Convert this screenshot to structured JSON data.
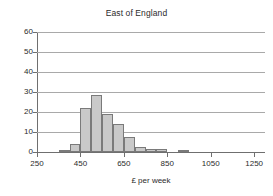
{
  "chart_data": {
    "type": "bar",
    "title": "East of England",
    "xlabel": "£ per week",
    "ylabel": "",
    "xlim": [
      250,
      1300
    ],
    "ylim": [
      0,
      60
    ],
    "grid": true,
    "legend": null,
    "xticks": [
      250,
      450,
      650,
      850,
      1050,
      1250
    ],
    "yticks": [
      0,
      10,
      20,
      30,
      40,
      50,
      60
    ],
    "bin_width": 50,
    "bins": [
      {
        "start": 350,
        "end": 400,
        "value": 0.5
      },
      {
        "start": 400,
        "end": 450,
        "value": 4.2
      },
      {
        "start": 450,
        "end": 500,
        "value": 22.0
      },
      {
        "start": 500,
        "end": 550,
        "value": 28.5
      },
      {
        "start": 550,
        "end": 600,
        "value": 19.0
      },
      {
        "start": 600,
        "end": 650,
        "value": 14.2
      },
      {
        "start": 650,
        "end": 700,
        "value": 7.6
      },
      {
        "start": 700,
        "end": 750,
        "value": 2.5
      },
      {
        "start": 750,
        "end": 800,
        "value": 1.4
      },
      {
        "start": 800,
        "end": 850,
        "value": 1.4
      },
      {
        "start": 900,
        "end": 950,
        "value": 0.5
      }
    ],
    "categories": [
      "350-400",
      "400-450",
      "450-500",
      "500-550",
      "550-600",
      "600-650",
      "650-700",
      "700-750",
      "750-800",
      "800-850",
      "900-950"
    ],
    "values": [
      0.5,
      4.2,
      22.0,
      28.5,
      19.0,
      14.2,
      7.6,
      2.5,
      1.4,
      1.4,
      0.5
    ],
    "colors": {
      "bar_fill": "#c9c9c9",
      "bar_stroke": "#7a7a7a",
      "gridline": "#a9a9a9",
      "axis": "#6f6f6f",
      "text": "#2b2b2b",
      "background": "#ffffff"
    }
  }
}
